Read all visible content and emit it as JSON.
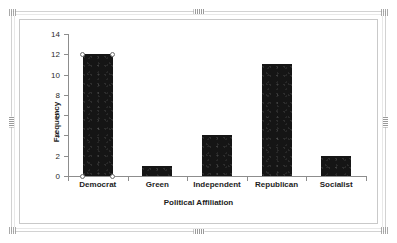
{
  "object": {
    "selected": true,
    "handles": [
      "top-center",
      "bottom-center",
      "left-middle",
      "right-middle",
      "corner-top-left",
      "corner-top-right",
      "corner-bottom-left",
      "corner-bottom-right"
    ]
  },
  "colors": {
    "bar": "#151515",
    "axis": "#8d8d8d",
    "text": "#1d1d1d",
    "frame": "#d2d2d2",
    "chart_border": "#c9c9c9",
    "background": "#ffffff",
    "handle_fill": "#ffffff",
    "handle_stroke": "#6d6d6d"
  },
  "chart_data": {
    "type": "bar",
    "title": "",
    "xlabel": "Political Affiliation",
    "ylabel": "Frequency",
    "categories": [
      "Democrat",
      "Green",
      "Independent",
      "Republican",
      "Socialist"
    ],
    "values": [
      12,
      1,
      4,
      11,
      2
    ],
    "ylim": [
      0,
      14
    ],
    "ytick_labels": [
      "0",
      "2",
      "4",
      "6",
      "8",
      "10",
      "12",
      "14"
    ],
    "ytick_values": [
      0,
      2,
      4,
      6,
      8,
      10,
      12,
      14
    ],
    "grid": false,
    "legend": null,
    "orientation": "vertical",
    "selected_category": "Democrat",
    "selected_handles": 4
  }
}
